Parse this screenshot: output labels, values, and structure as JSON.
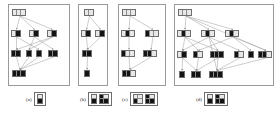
{
  "figure": {
    "type": "multi-panel-dag-diagram",
    "panel_count": 4,
    "colors": {
      "panel_border": "#9a9a9a",
      "node_border": "#6e6e6e",
      "cell_empty": "#e8e8e8",
      "cell_filled": "#141414",
      "edge": "#9b9b9b",
      "background": "#ffffff",
      "text": "#1a1a1a"
    },
    "panels": [
      {
        "id": "a",
        "label": "(a)",
        "box": {
          "x": 8,
          "y": 4,
          "w": 62,
          "h": 82
        },
        "caption": {
          "x": 26,
          "y": 92
        },
        "legend": [
          {
            "rows": [
              [
                "w"
              ],
              [
                "b"
              ]
            ]
          }
        ],
        "nodes": [
          {
            "name": "node-a-l0-0",
            "x": 12,
            "y": 9,
            "cells": [
              "w",
              "w",
              "w"
            ]
          },
          {
            "name": "node-a-l1-0",
            "x": 11,
            "y": 30,
            "cells": [
              "w",
              "b"
            ]
          },
          {
            "name": "node-a-l1-1",
            "x": 29,
            "y": 30,
            "cells": [
              "w",
              "b"
            ]
          },
          {
            "name": "node-a-l1-2",
            "x": 47,
            "y": 30,
            "cells": [
              "w",
              "b"
            ]
          },
          {
            "name": "node-a-l2-0",
            "x": 11,
            "y": 50,
            "cells": [
              "b",
              "b"
            ]
          },
          {
            "name": "node-a-l2-1",
            "x": 26,
            "y": 50,
            "cells": [
              "b"
            ]
          },
          {
            "name": "node-a-l2-2",
            "x": 36,
            "y": 50,
            "cells": [
              "b"
            ]
          },
          {
            "name": "node-a-l2-3",
            "x": 48,
            "y": 50,
            "cells": [
              "b",
              "b"
            ]
          },
          {
            "name": "node-a-l3-0",
            "x": 12,
            "y": 70,
            "cells": [
              "b",
              "b",
              "b"
            ]
          }
        ],
        "edges": [
          [
            0,
            1
          ],
          [
            0,
            2
          ],
          [
            0,
            3
          ],
          [
            1,
            4
          ],
          [
            1,
            6
          ],
          [
            2,
            5
          ],
          [
            2,
            7
          ],
          [
            3,
            5
          ],
          [
            3,
            4
          ],
          [
            4,
            8
          ],
          [
            5,
            8
          ],
          [
            6,
            8
          ],
          [
            7,
            8
          ]
        ]
      },
      {
        "id": "b",
        "label": "(b)",
        "box": {
          "x": 78,
          "y": 4,
          "w": 30,
          "h": 82
        },
        "caption": {
          "x": 80,
          "y": 92
        },
        "legend": [
          {
            "rows": [
              [
                "w"
              ],
              [
                "b"
              ]
            ]
          },
          {
            "rows": [
              [
                "b",
                "w"
              ],
              [
                "b",
                "b"
              ]
            ]
          }
        ],
        "nodes": [
          {
            "name": "node-b-l0-0",
            "x": 84,
            "y": 9,
            "cells": [
              "w",
              "w"
            ]
          },
          {
            "name": "node-b-l1-0",
            "x": 81,
            "y": 30,
            "cells": [
              "w",
              "b"
            ]
          },
          {
            "name": "node-b-l1-1",
            "x": 95,
            "y": 30,
            "cells": [
              "w",
              "b"
            ]
          },
          {
            "name": "node-b-l2-0",
            "x": 82,
            "y": 50,
            "cells": [
              "b",
              "b"
            ]
          },
          {
            "name": "node-b-l3-0",
            "x": 84,
            "y": 70,
            "cells": [
              "b"
            ]
          }
        ],
        "edges": [
          [
            0,
            1
          ],
          [
            0,
            2
          ],
          [
            1,
            3
          ],
          [
            2,
            3
          ],
          [
            3,
            4
          ]
        ]
      },
      {
        "id": "c",
        "label": "(c)",
        "box": {
          "x": 118,
          "y": 4,
          "w": 48,
          "h": 82
        },
        "caption": {
          "x": 122,
          "y": 92
        },
        "legend": [
          {
            "rows": [
              [
                "w",
                "w"
              ],
              [
                "b",
                "w"
              ]
            ]
          },
          {
            "rows": [
              [
                "b",
                "w"
              ],
              [
                "b",
                "b"
              ]
            ]
          }
        ],
        "nodes": [
          {
            "name": "node-c-l0-0",
            "x": 122,
            "y": 9,
            "cells": [
              "w",
              "w",
              "w"
            ]
          },
          {
            "name": "node-c-l1-0",
            "x": 121,
            "y": 30,
            "cells": [
              "w",
              "b",
              "w"
            ]
          },
          {
            "name": "node-c-l1-1",
            "x": 145,
            "y": 30,
            "cells": [
              "b",
              "w",
              "w"
            ]
          },
          {
            "name": "node-c-l2-0",
            "x": 121,
            "y": 50,
            "cells": [
              "b",
              "w",
              "w"
            ]
          },
          {
            "name": "node-c-l2-1",
            "x": 143,
            "y": 50,
            "cells": [
              "b",
              "b",
              "w"
            ]
          },
          {
            "name": "node-c-l3-0",
            "x": 122,
            "y": 70,
            "cells": [
              "b",
              "b",
              "w"
            ]
          }
        ],
        "edges": [
          [
            0,
            1
          ],
          [
            0,
            2
          ],
          [
            1,
            3
          ],
          [
            2,
            4
          ],
          [
            3,
            5
          ],
          [
            4,
            5
          ]
        ]
      },
      {
        "id": "d",
        "label": "(d)",
        "box": {
          "x": 174,
          "y": 4,
          "w": 100,
          "h": 82
        },
        "caption": {
          "x": 196,
          "y": 92
        },
        "legend": [
          {
            "rows": [
              [
                "w"
              ],
              [
                "b"
              ]
            ]
          },
          {
            "rows": [
              [
                "b",
                "w"
              ],
              [
                "b",
                "b"
              ]
            ]
          }
        ],
        "nodes": [
          {
            "name": "node-d-l0-0",
            "x": 178,
            "y": 9,
            "cells": [
              "w",
              "w",
              "w"
            ]
          },
          {
            "name": "node-d-l1-0",
            "x": 177,
            "y": 30,
            "cells": [
              "w",
              "b",
              "w"
            ]
          },
          {
            "name": "node-d-l1-1",
            "x": 201,
            "y": 30,
            "cells": [
              "w",
              "b",
              "w"
            ]
          },
          {
            "name": "node-d-l1-2",
            "x": 225,
            "y": 30,
            "cells": [
              "w",
              "b",
              "w"
            ]
          },
          {
            "name": "node-d-l2-0",
            "x": 177,
            "y": 51,
            "cells": [
              "w",
              "b"
            ]
          },
          {
            "name": "node-d-l2-1",
            "x": 193,
            "y": 51,
            "cells": [
              "b",
              "w"
            ]
          },
          {
            "name": "node-d-l2-2",
            "x": 210,
            "y": 51,
            "cells": [
              "b",
              "b",
              "b"
            ]
          },
          {
            "name": "node-d-l2-3",
            "x": 234,
            "y": 51,
            "cells": [
              "b",
              "w"
            ]
          },
          {
            "name": "node-d-l2-4",
            "x": 248,
            "y": 51,
            "cells": [
              "b"
            ]
          },
          {
            "name": "node-d-l2-5",
            "x": 258,
            "y": 51,
            "cells": [
              "b",
              "b",
              "w"
            ]
          },
          {
            "name": "node-d-l3-0",
            "x": 179,
            "y": 71,
            "cells": [
              "b"
            ]
          },
          {
            "name": "node-d-l3-1",
            "x": 191,
            "y": 71,
            "cells": [
              "b",
              "b"
            ]
          },
          {
            "name": "node-d-l3-2",
            "x": 209,
            "y": 71,
            "cells": [
              "b",
              "b",
              "b"
            ]
          }
        ],
        "edges": [
          [
            0,
            1
          ],
          [
            0,
            2
          ],
          [
            0,
            3
          ],
          [
            0,
            9
          ],
          [
            1,
            4
          ],
          [
            1,
            5
          ],
          [
            1,
            6
          ],
          [
            2,
            4
          ],
          [
            2,
            6
          ],
          [
            2,
            7
          ],
          [
            3,
            5
          ],
          [
            3,
            8
          ],
          [
            3,
            9
          ],
          [
            4,
            10
          ],
          [
            4,
            11
          ],
          [
            5,
            11
          ],
          [
            6,
            11
          ],
          [
            6,
            12
          ],
          [
            7,
            12
          ],
          [
            9,
            12
          ],
          [
            2,
            12
          ]
        ]
      }
    ]
  }
}
